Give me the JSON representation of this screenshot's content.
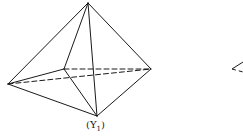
{
  "figure": {
    "caption": "(Y",
    "caption_sub": "1",
    "caption_close": ")",
    "stroke_color": "#1a1a1a",
    "background": "#ffffff"
  },
  "diagram": {
    "type": "octahedron-bipyramid",
    "vertices": {
      "apex": [
        88,
        3
      ],
      "left": [
        8,
        84
      ],
      "right": [
        151,
        69
      ],
      "back": [
        64,
        69
      ],
      "front_bottom": [
        97,
        116
      ]
    },
    "solid_edges": [
      [
        "apex",
        "left"
      ],
      [
        "apex",
        "right"
      ],
      [
        "apex",
        "back"
      ],
      [
        "apex",
        "front_bottom"
      ],
      [
        "left",
        "back"
      ],
      [
        "left",
        "front_bottom"
      ],
      [
        "back",
        "front_bottom"
      ],
      [
        "right",
        "front_bottom"
      ]
    ],
    "dashed_edges": [
      [
        "back",
        "right"
      ],
      [
        "left",
        "right"
      ]
    ],
    "partial_second_figure": {
      "vertex": [
        232,
        69
      ],
      "solid_edge_to": [
        243,
        62
      ],
      "dashed_edge_to": [
        243,
        72
      ]
    }
  }
}
